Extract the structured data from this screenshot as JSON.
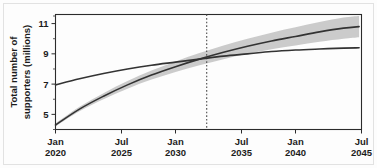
{
  "figure": {
    "background_color": "#fdfdfd",
    "border_color": "#e2e2e2",
    "line_color": "#333333",
    "band_color": "#b7b7b7",
    "axis_color": "#2b2b2b"
  },
  "chart_data": {
    "type": "line",
    "title": "",
    "subtitle": "",
    "xlabel": "",
    "ylabel": "Total number of supporters (millions)",
    "ylabel_lines": [
      "Total number of",
      "supporters (millions)"
    ],
    "grid": false,
    "legend": null,
    "legend_position": "none",
    "xlim": [
      2020.0,
      2045.5
    ],
    "ylim": [
      4.0,
      11.6
    ],
    "yticks": [
      5,
      7,
      9,
      11
    ],
    "ytick_labels": [
      "5",
      "7",
      "9",
      "11"
    ],
    "yticks_minor": [
      4,
      6,
      8,
      10,
      11.5
    ],
    "xticks": [
      2020.0,
      2025.5,
      2030.0,
      2035.5,
      2040.0,
      2045.5
    ],
    "xtick_labels": [
      {
        "month": "Jan",
        "year": "2020"
      },
      {
        "month": "Jul",
        "year": "2025"
      },
      {
        "month": "Jan",
        "year": "2030"
      },
      {
        "month": "Jul",
        "year": "2035"
      },
      {
        "month": "Jan",
        "year": "2040"
      },
      {
        "month": "Jul",
        "year": "2045"
      }
    ],
    "annotations": [
      {
        "name": "crossover-vertical-line",
        "type": "vline",
        "x": 2032.6,
        "style": "dotted",
        "label": ""
      }
    ],
    "x": [
      2020.0,
      2022.0,
      2024.0,
      2026.0,
      2028.0,
      2030.0,
      2032.0,
      2034.0,
      2036.0,
      2038.0,
      2040.0,
      2042.0,
      2044.0,
      2045.3
    ],
    "series": [
      {
        "name": "Projected growth (with confidence interval)",
        "values": [
          4.3,
          5.35,
          6.2,
          6.95,
          7.6,
          8.15,
          8.65,
          9.1,
          9.5,
          9.85,
          10.15,
          10.45,
          10.7,
          10.8
        ],
        "ci_lower": [
          4.2,
          5.2,
          6.0,
          6.7,
          7.3,
          7.8,
          8.25,
          8.65,
          9.0,
          9.3,
          9.55,
          9.8,
          10.0,
          10.1
        ],
        "ci_upper": [
          4.4,
          5.5,
          6.4,
          7.2,
          7.9,
          8.5,
          9.05,
          9.55,
          10.0,
          10.4,
          10.75,
          11.1,
          11.4,
          11.5
        ],
        "has_band": true
      },
      {
        "name": "Baseline trajectory",
        "values": [
          6.95,
          7.35,
          7.7,
          8.0,
          8.25,
          8.45,
          8.65,
          8.85,
          9.0,
          9.15,
          9.25,
          9.32,
          9.38,
          9.4
        ],
        "has_band": false
      }
    ]
  }
}
